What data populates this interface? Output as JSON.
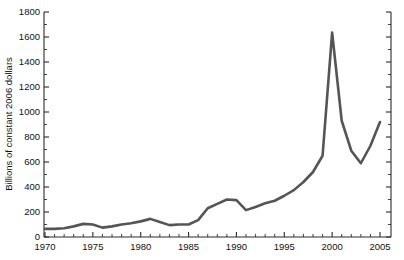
{
  "chart_data": {
    "type": "line",
    "title": "",
    "subtitle": "",
    "xlabel": "",
    "ylabel": "Billions of constant 2006 dollars",
    "xlim": [
      1970,
      2005
    ],
    "ylim": [
      0,
      1800
    ],
    "ytick_step": 200,
    "ytick_minor_step": 100,
    "xtick_step": 5,
    "xtick_minor_step": 1,
    "grid": false,
    "legend": null,
    "legend_position": "none",
    "line_color": "#555555",
    "line_width": 2.6,
    "axis_color": "#2b2b2b",
    "background": "#ffffff",
    "right_axis_visible": true,
    "right_axis_ticks": true,
    "x": [
      1970,
      1971,
      1972,
      1973,
      1974,
      1975,
      1976,
      1977,
      1978,
      1979,
      1980,
      1981,
      1982,
      1983,
      1984,
      1985,
      1986,
      1987,
      1988,
      1989,
      1990,
      1991,
      1992,
      1993,
      1994,
      1995,
      1996,
      1997,
      1998,
      1999,
      2000,
      2001,
      2002,
      2003,
      2004,
      2005
    ],
    "values": [
      65,
      65,
      70,
      85,
      105,
      100,
      75,
      85,
      100,
      110,
      125,
      145,
      120,
      95,
      100,
      100,
      135,
      230,
      265,
      300,
      295,
      215,
      240,
      270,
      290,
      330,
      375,
      440,
      520,
      650,
      1635,
      930,
      690,
      590,
      730,
      920
    ],
    "xtick_labels": [
      "1970",
      "1975",
      "1980",
      "1985",
      "1990",
      "1995",
      "2000",
      "2005"
    ],
    "xtick_values": [
      1970,
      1975,
      1980,
      1985,
      1990,
      1995,
      2000,
      2005
    ],
    "ytick_labels": [
      "0",
      "200",
      "400",
      "600",
      "800",
      "1000",
      "1200",
      "1400",
      "1600",
      "1800"
    ],
    "ytick_values": [
      0,
      200,
      400,
      600,
      800,
      1000,
      1200,
      1400,
      1600,
      1800
    ],
    "annotations": []
  }
}
